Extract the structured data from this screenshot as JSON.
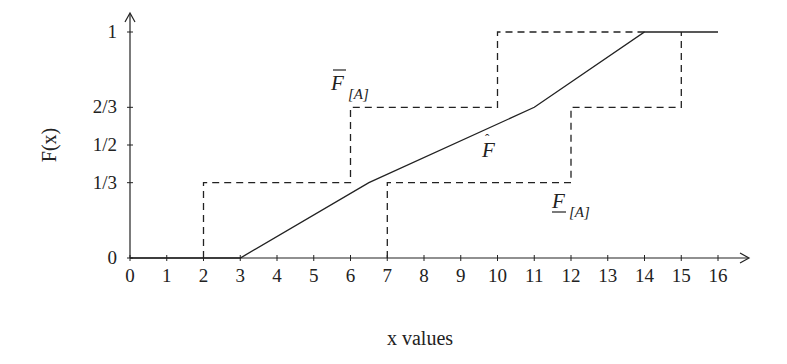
{
  "chart_data": {
    "type": "line",
    "title": "",
    "xlabel": "x values",
    "ylabel": "F(x)",
    "xlim": [
      0,
      16
    ],
    "ylim": [
      0,
      1
    ],
    "grid": false,
    "legend": "none (inline labels)",
    "x_ticks": [
      "0",
      "1",
      "2",
      "3",
      "4",
      "5",
      "6",
      "7",
      "8",
      "9",
      "10",
      "11",
      "12",
      "13",
      "14",
      "15",
      "16"
    ],
    "y_ticks": [
      {
        "value": 0,
        "label": "0"
      },
      {
        "value": 0.3333,
        "label": "1/3"
      },
      {
        "value": 0.5,
        "label": "1/2"
      },
      {
        "value": 0.6667,
        "label": "2/3"
      },
      {
        "value": 1,
        "label": "1"
      }
    ],
    "series": [
      {
        "name": "upper bound F̄[A]",
        "style": "dashed",
        "label_main": "F",
        "label_sub": "[A]",
        "label_decoration": "overline",
        "points": [
          [
            2,
            0
          ],
          [
            2,
            0.3333
          ],
          [
            6,
            0.3333
          ],
          [
            6,
            0.6667
          ],
          [
            10,
            0.6667
          ],
          [
            10,
            1
          ],
          [
            14,
            1
          ]
        ]
      },
      {
        "name": "lower bound F_[A]",
        "style": "dashed",
        "label_main": "F",
        "label_sub": "[A]",
        "label_decoration": "underline",
        "points": [
          [
            7,
            0
          ],
          [
            7,
            0.3333
          ],
          [
            12,
            0.3333
          ],
          [
            12,
            0.6667
          ],
          [
            15,
            0.6667
          ],
          [
            15,
            1
          ]
        ]
      },
      {
        "name": "estimate F̂",
        "style": "solid",
        "label_main": "F",
        "label_decoration": "hat",
        "points": [
          [
            0,
            0
          ],
          [
            3,
            0
          ],
          [
            6.5,
            0.3333
          ],
          [
            11,
            0.6667
          ],
          [
            14,
            1
          ],
          [
            16,
            1
          ]
        ]
      }
    ]
  }
}
